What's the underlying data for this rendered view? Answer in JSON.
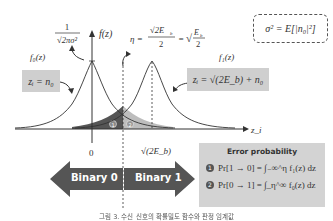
{
  "diagram": {
    "type": "bpsk-decision-threshold",
    "y_axis_label": "f(z)",
    "x_axis_label": "z_i",
    "peak_label": "1/√(2πσ²)",
    "threshold_label": "η = √(2E_b)/2 = √(E_b/2)",
    "f0_label": "f₀(z)",
    "f1_label": "f₁(z)",
    "f0_model": "zᵢ = n₀",
    "f1_model": "zᵢ = √(2E_b) + n₀",
    "sigma_def": "σ² = E[|n₀|²]",
    "tick_zero": "0",
    "tick_signal": "√(2E_b)",
    "region_1": "①",
    "region_2": "②",
    "binary_left": "Binary 0",
    "binary_right": "Binary 1",
    "error_box": {
      "title": "Error probability",
      "rows": [
        {
          "marker": "①",
          "formula": "Pr[1 → 0] = ∫₋∞^η f₁(z) dz"
        },
        {
          "marker": "②",
          "formula": "Pr[0 → 1] = ∫_η^∞ f₀(z) dz"
        }
      ]
    },
    "caption": "그림 3. 수신 신호의 확률밀도 함수와 판정 임계값",
    "colors": {
      "arrow": "#555555",
      "dark_region": "#555555",
      "light_region": "#bdbdbd",
      "box_fill": "#d3d3d3",
      "curve": "#333333"
    }
  }
}
